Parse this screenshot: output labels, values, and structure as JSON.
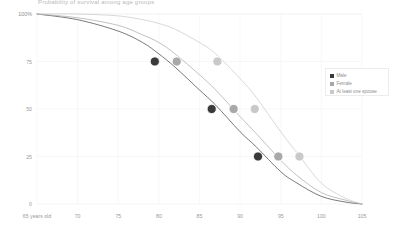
{
  "chart_data": {
    "type": "line",
    "title": "Probability of survival among age groups",
    "xlabel": "",
    "ylabel": "",
    "xlim": [
      65,
      105
    ],
    "ylim": [
      0,
      100
    ],
    "grid": true,
    "legend_position": "right",
    "x_ticks": [
      65,
      70,
      75,
      80,
      85,
      90,
      95,
      100,
      105
    ],
    "x_tick_labels": [
      "65 years old",
      "70",
      "75",
      "80",
      "85",
      "90",
      "95",
      "100",
      "105"
    ],
    "y_ticks": [
      0,
      25,
      50,
      75,
      100
    ],
    "y_tick_labels": [
      "0",
      "25",
      "50",
      "75",
      "100%"
    ],
    "series": [
      {
        "name": "Male",
        "color": "#3a3a3a",
        "x": [
          65,
          70,
          75,
          78,
          80,
          82,
          85,
          87,
          90,
          92,
          95,
          97,
          100,
          103,
          105
        ],
        "values": [
          100,
          97,
          91,
          85,
          79,
          72,
          60,
          52,
          38,
          30,
          17,
          11,
          4,
          1,
          0
        ],
        "markers": [
          {
            "x": 79.5,
            "y": 75
          },
          {
            "x": 86.5,
            "y": 50
          },
          {
            "x": 92.2,
            "y": 25
          }
        ]
      },
      {
        "name": "Female",
        "color": "#a8a8a8",
        "x": [
          65,
          70,
          75,
          78,
          80,
          82,
          85,
          87,
          90,
          92,
          95,
          97,
          100,
          103,
          105
        ],
        "values": [
          100,
          98,
          94,
          89,
          85,
          79,
          68,
          60,
          46,
          37,
          23,
          15,
          6,
          2,
          0
        ],
        "markers": [
          {
            "x": 82.2,
            "y": 75
          },
          {
            "x": 89.2,
            "y": 50
          },
          {
            "x": 94.7,
            "y": 25
          }
        ]
      },
      {
        "name": "At least one spouse",
        "color": "#c9c9c9",
        "x": [
          65,
          70,
          75,
          78,
          80,
          82,
          85,
          87,
          90,
          92,
          95,
          97,
          100,
          103,
          105
        ],
        "values": [
          100,
          100,
          99,
          97,
          95,
          92,
          85,
          79,
          66,
          56,
          38,
          27,
          11,
          3,
          0
        ],
        "markers": [
          {
            "x": 87.2,
            "y": 75
          },
          {
            "x": 91.8,
            "y": 50
          },
          {
            "x": 97.3,
            "y": 25
          }
        ]
      }
    ],
    "legend": [
      {
        "label": "Male",
        "color": "#3a3a3a"
      },
      {
        "label": "Female",
        "color": "#a8a8a8"
      },
      {
        "label": "At least one spouse",
        "color": "#c9c9c9"
      }
    ]
  }
}
